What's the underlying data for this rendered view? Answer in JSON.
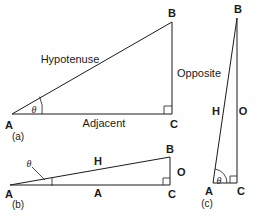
{
  "figure": {
    "background_color": "#ffffff",
    "ink_color": "#1a1a1a"
  },
  "panels": [
    {
      "id": "a",
      "caption": "(a)",
      "vertices": {
        "A": "A",
        "B": "B",
        "C": "C"
      },
      "sides": {
        "hypotenuse": "Hypotenuse",
        "opposite": "Opposite",
        "adjacent": "Adjacent"
      },
      "angle": "θ",
      "right_angle_at": "C"
    },
    {
      "id": "b",
      "caption": "(b)",
      "vertices": {
        "A": "A",
        "B": "B",
        "C": "C"
      },
      "sides": {
        "hypotenuse": "H",
        "opposite": "O",
        "adjacent": "A"
      },
      "angle": "θ",
      "right_angle_at": "C"
    },
    {
      "id": "c",
      "caption": "(c)",
      "vertices": {
        "A": "A",
        "B": "B",
        "C": "C"
      },
      "sides": {
        "hypotenuse": "H",
        "opposite": "O"
      },
      "angle": "θ",
      "right_angle_at": "C"
    }
  ]
}
